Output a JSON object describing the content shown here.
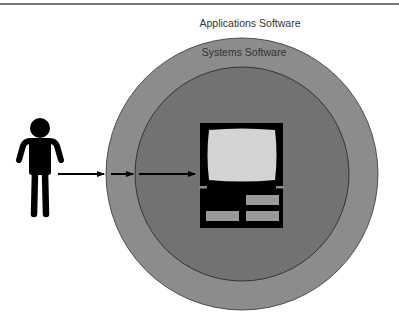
{
  "diagram": {
    "labels": {
      "outer": "Applications Software",
      "inner": "Systems Software"
    },
    "nodes": [
      {
        "id": "user",
        "kind": "person-icon"
      },
      {
        "id": "applications-software",
        "kind": "outer-ring"
      },
      {
        "id": "systems-software",
        "kind": "inner-circle"
      },
      {
        "id": "hardware",
        "kind": "computer-icon"
      }
    ],
    "edges": [
      {
        "from": "user",
        "to": "applications-software"
      },
      {
        "from": "applications-software",
        "to": "systems-software"
      },
      {
        "from": "systems-software",
        "to": "hardware"
      }
    ],
    "colors": {
      "outer_ring": "#8c8c8c",
      "inner_circle": "#727272",
      "ink": "#000000",
      "screen": "#d4d4d4",
      "slot": "#9a9a9a"
    }
  }
}
